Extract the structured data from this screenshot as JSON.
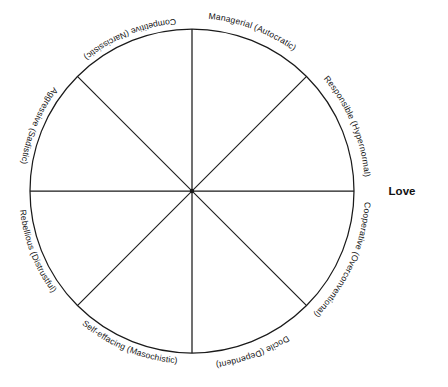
{
  "figure": {
    "type": "circumplex-diagram",
    "background_color": "#ffffff",
    "line_color": "#1a1a1a",
    "text_color": "#141414"
  },
  "circle": {
    "center_x": 192,
    "center_y": 191,
    "radius": 162
  },
  "axis_labels": [
    {
      "id": "love",
      "text": "Love",
      "position": "right"
    }
  ],
  "segments": [
    {
      "id": "managerial",
      "trait": "Managerial",
      "descriptor": "Autocratic",
      "label": "Managerial (Autocratic)",
      "octant": 1,
      "position": "upper-right-upper"
    },
    {
      "id": "responsible",
      "trait": "Responsible",
      "descriptor": "Hypernormal",
      "label": "Responsible (Hypernormal)",
      "octant": 2,
      "position": "upper-right-lower"
    },
    {
      "id": "cooperative",
      "trait": "Cooperative",
      "descriptor": "Overconventional",
      "label": "Cooperative (Overconventional)",
      "octant": 3,
      "position": "lower-right-upper"
    },
    {
      "id": "docile",
      "trait": "Docile",
      "descriptor": "Dependent",
      "label": "Docile (Dependent)",
      "octant": 4,
      "position": "lower-right-lower"
    },
    {
      "id": "self-effacing",
      "trait": "Self-effacing",
      "descriptor": "Masochistic",
      "label": "Self-effacing (Masochistic)",
      "octant": 5,
      "position": "lower-left-lower"
    },
    {
      "id": "rebellious",
      "trait": "Rebellious",
      "descriptor": "Distrustful",
      "label": "Rebellious (Distrustful)",
      "octant": 6,
      "position": "lower-left-upper"
    },
    {
      "id": "aggressive",
      "trait": "Aggressive",
      "descriptor": "Sadistic",
      "label": "Aggressive (Sadistic)",
      "octant": 7,
      "position": "upper-left-lower"
    },
    {
      "id": "competitive",
      "trait": "Competitive",
      "descriptor": "Narcissistic",
      "label": "Competitive (Narcissistic)",
      "octant": 8,
      "position": "upper-left-upper"
    }
  ]
}
